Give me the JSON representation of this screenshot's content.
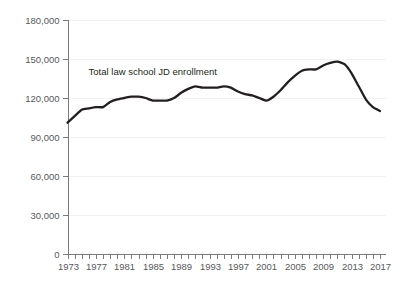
{
  "chart_data": {
    "type": "line",
    "title": "",
    "subtitle": "",
    "xlabel": "",
    "ylabel": "",
    "grid": "faint-horizontal",
    "legend_position": "inline-annotation",
    "annotations": [
      {
        "text": "Total law school JD enrollment",
        "x": 1985,
        "y": 138000
      }
    ],
    "series": [
      {
        "name": "Total law school JD enrollment",
        "color": "#231f20",
        "x": [
          1973,
          1974,
          1975,
          1976,
          1977,
          1978,
          1979,
          1980,
          1981,
          1982,
          1983,
          1984,
          1985,
          1986,
          1987,
          1988,
          1989,
          1990,
          1991,
          1992,
          1993,
          1994,
          1995,
          1996,
          1997,
          1998,
          1999,
          2000,
          2001,
          2002,
          2003,
          2004,
          2005,
          2006,
          2007,
          2008,
          2009,
          2010,
          2011,
          2012,
          2013,
          2014,
          2015,
          2016,
          2017
        ],
        "values": [
          101000,
          106000,
          111000,
          112000,
          113000,
          113000,
          117000,
          119000,
          120000,
          121000,
          121000,
          120000,
          118000,
          118000,
          118000,
          120000,
          124000,
          127000,
          129000,
          128000,
          128000,
          128000,
          129000,
          128000,
          125000,
          123000,
          122000,
          120000,
          118000,
          121000,
          126000,
          132000,
          137000,
          141000,
          142000,
          142000,
          145000,
          147000,
          148000,
          146000,
          139000,
          129000,
          119000,
          113000,
          110000
        ]
      }
    ],
    "y_axis": {
      "min": 0,
      "max": 180000,
      "tick_step": 30000,
      "ticks": [
        {
          "value": 180000,
          "label": "180,000"
        },
        {
          "value": 150000,
          "label": "150,000"
        },
        {
          "value": 120000,
          "label": "120,000"
        },
        {
          "value": 90000,
          "label": "90,000"
        },
        {
          "value": 60000,
          "label": "60,000"
        },
        {
          "value": 30000,
          "label": "30,000"
        },
        {
          "value": 0,
          "label": "0"
        }
      ]
    },
    "x_axis": {
      "min": 1973,
      "max": 2017,
      "minor_tick_step": 1,
      "label_step": 4,
      "ticks": [
        {
          "value": 1973,
          "label": "1973"
        },
        {
          "value": 1974,
          "label": ""
        },
        {
          "value": 1975,
          "label": ""
        },
        {
          "value": 1976,
          "label": ""
        },
        {
          "value": 1977,
          "label": "1977"
        },
        {
          "value": 1978,
          "label": ""
        },
        {
          "value": 1979,
          "label": ""
        },
        {
          "value": 1980,
          "label": ""
        },
        {
          "value": 1981,
          "label": "1981"
        },
        {
          "value": 1982,
          "label": ""
        },
        {
          "value": 1983,
          "label": ""
        },
        {
          "value": 1984,
          "label": ""
        },
        {
          "value": 1985,
          "label": "1985"
        },
        {
          "value": 1986,
          "label": ""
        },
        {
          "value": 1987,
          "label": ""
        },
        {
          "value": 1988,
          "label": ""
        },
        {
          "value": 1989,
          "label": "1989"
        },
        {
          "value": 1990,
          "label": ""
        },
        {
          "value": 1991,
          "label": ""
        },
        {
          "value": 1992,
          "label": ""
        },
        {
          "value": 1993,
          "label": "1993"
        },
        {
          "value": 1994,
          "label": ""
        },
        {
          "value": 1995,
          "label": ""
        },
        {
          "value": 1996,
          "label": ""
        },
        {
          "value": 1997,
          "label": "1997"
        },
        {
          "value": 1998,
          "label": ""
        },
        {
          "value": 1999,
          "label": ""
        },
        {
          "value": 2000,
          "label": ""
        },
        {
          "value": 2001,
          "label": "2001"
        },
        {
          "value": 2002,
          "label": ""
        },
        {
          "value": 2003,
          "label": ""
        },
        {
          "value": 2004,
          "label": ""
        },
        {
          "value": 2005,
          "label": "2005"
        },
        {
          "value": 2006,
          "label": ""
        },
        {
          "value": 2007,
          "label": ""
        },
        {
          "value": 2008,
          "label": ""
        },
        {
          "value": 2009,
          "label": "2009"
        },
        {
          "value": 2010,
          "label": ""
        },
        {
          "value": 2011,
          "label": ""
        },
        {
          "value": 2012,
          "label": ""
        },
        {
          "value": 2013,
          "label": "2013"
        },
        {
          "value": 2014,
          "label": ""
        },
        {
          "value": 2015,
          "label": ""
        },
        {
          "value": 2016,
          "label": ""
        },
        {
          "value": 2017,
          "label": "2017"
        }
      ]
    },
    "colors": {
      "line": "#231f20",
      "axis": "#7a7b7d",
      "tick_text": "#58595b",
      "grid": "#f2f2f2",
      "background": "#ffffff"
    }
  }
}
